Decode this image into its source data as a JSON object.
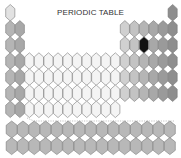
{
  "title": "PERIODIC TABLE",
  "colors": {
    "s_block_1": "#b5b5b5",
    "s_block_2": "#a8a8a8",
    "h_cell": "#e2e2e2",
    "d_block": "#f4f4f4",
    "p_block_light": "#d0d0d0",
    "p_block_dark": "#9a9a9a",
    "noble": "#8e8e8e",
    "highlight": "#111111",
    "f_block": "#b8b8b8",
    "stroke": "#7a7a7a"
  },
  "main_table": {
    "periods": [
      {
        "period": 1,
        "groups": [
          1,
          18
        ]
      },
      {
        "period": 2,
        "groups": [
          1,
          2,
          13,
          14,
          15,
          16,
          17,
          18
        ]
      },
      {
        "period": 3,
        "groups": [
          1,
          2,
          13,
          14,
          15,
          16,
          17,
          18
        ]
      },
      {
        "period": 4,
        "groups": [
          1,
          2,
          3,
          4,
          5,
          6,
          7,
          8,
          9,
          10,
          11,
          12,
          13,
          14,
          15,
          16,
          17,
          18
        ]
      },
      {
        "period": 5,
        "groups": [
          1,
          2,
          3,
          4,
          5,
          6,
          7,
          8,
          9,
          10,
          11,
          12,
          13,
          14,
          15,
          16,
          17,
          18
        ]
      },
      {
        "period": 6,
        "groups": [
          1,
          2,
          3,
          4,
          5,
          6,
          7,
          8,
          9,
          10,
          11,
          12,
          13,
          14,
          15,
          16,
          17,
          18
        ]
      },
      {
        "period": 7,
        "groups": [
          1,
          2,
          3,
          4,
          5,
          6,
          7,
          8,
          9,
          10,
          11,
          12
        ]
      }
    ],
    "highlighted": {
      "period": 3,
      "group": 15
    }
  },
  "f_block": {
    "rows": 2,
    "columns": 15
  }
}
